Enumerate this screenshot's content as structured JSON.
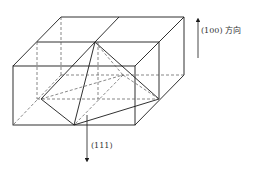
{
  "diagram": {
    "type": "crystal-structure-3d",
    "labels": {
      "direction_100": "(100) 方向",
      "direction_111": "(111)"
    },
    "colors": {
      "line": "#1a1a1a",
      "dashed": "#555555",
      "background": "#ffffff"
    }
  }
}
